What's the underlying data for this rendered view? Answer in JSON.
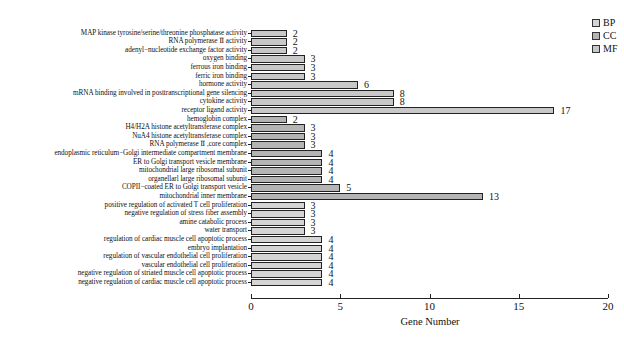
{
  "chart_data": {
    "type": "bar",
    "orientation": "horizontal",
    "title": "",
    "xlabel": "Gene Number",
    "ylabel": "",
    "xlim": [
      0,
      20
    ],
    "xticks": [
      0,
      5,
      10,
      15,
      20
    ],
    "grid": false,
    "legend_position": "top-right",
    "legend": [
      {
        "name": "BP",
        "color": "#d4d4d4"
      },
      {
        "name": "CC",
        "color": "#b4b4b4"
      },
      {
        "name": "MF",
        "color": "#c8c8c8"
      }
    ],
    "categories": [
      "MAP kinase tyrosine/serine/threonine phosphatase activity",
      "RNA polymerase Ⅱ activity",
      "adenyl−nucleotide exchange factor activity",
      "oxygen binding",
      "ferrous iron binding",
      "ferric iron binding",
      "hormone activity",
      "mRNA binding involved in posttranscriptional gene silencing",
      "cytokine activity",
      "receptor ligand activity",
      "hemoglobin complex",
      "H4/H2A histone acetyltransferase complex",
      "NuA4 histone acetyltransferase complex",
      "RNA polymerase Ⅱ ,core complex",
      "endoplasmic reticulum−Golgi intermediate compartment membrane",
      "ER to Golgi transport vesicle membrane",
      "mitochondrial large ribosomal subunit",
      "organellarl large ribosomal subunit",
      "COPII−coated ER to Golgi transport vesicle",
      "mitochondrial inner membrane",
      "positive regulation of activated T cell proliferation",
      "negative regulation of stress fiber assembly",
      "amine catabolic process",
      "water transport",
      "regulation of cardiac muscle cell apoptotic process",
      "embryo implantation",
      "regulation of vascular endothelial cell proliferation",
      "vascular endothelial cell proliferation",
      "negative regulation of striated muscle cell apoptotic process",
      "negative regulation of cardiac muscle cell apoptotic process"
    ],
    "values": [
      2,
      2,
      2,
      3,
      3,
      3,
      6,
      8,
      8,
      17,
      2,
      3,
      3,
      3,
      4,
      4,
      4,
      4,
      5,
      13,
      3,
      3,
      3,
      3,
      4,
      4,
      4,
      4,
      4,
      4
    ],
    "groups": [
      "MF",
      "MF",
      "MF",
      "MF",
      "MF",
      "MF",
      "MF",
      "MF",
      "MF",
      "MF",
      "CC",
      "CC",
      "CC",
      "CC",
      "CC",
      "CC",
      "CC",
      "CC",
      "CC",
      "CC",
      "BP",
      "BP",
      "BP",
      "BP",
      "BP",
      "BP",
      "BP",
      "BP",
      "BP",
      "BP"
    ]
  }
}
